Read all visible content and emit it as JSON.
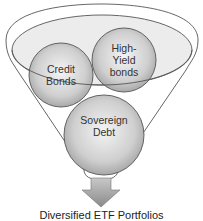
{
  "diagram": {
    "type": "funnel",
    "inputs": [
      {
        "label": "Credit Bonds",
        "line1": "Credit",
        "line2": "Bonds"
      },
      {
        "label": "High-Yield bonds",
        "line1": "High-",
        "line2": "Yield",
        "line3": "bonds"
      },
      {
        "label": "Sovereign Debt",
        "line1": "Sovereign",
        "line2": "Debt"
      }
    ],
    "output": {
      "label": "Diversified ETF Portfolios"
    },
    "colors": {
      "outline": "#555555",
      "funnel_fill": "#ffffff",
      "ellipse_fill": "#eeeeee",
      "circle_center": "#f4f4f4",
      "circle_edge": "#a8a8a8",
      "arrow": "#9a9a9a"
    }
  }
}
